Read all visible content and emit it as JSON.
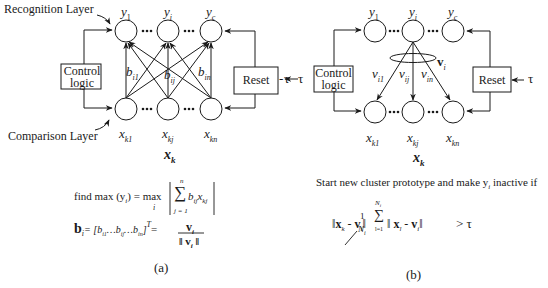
{
  "panel_a": {
    "recognition_label": "Recognition Layer",
    "comparison_label": "Comparison Layer",
    "control_label_1": "Control",
    "control_label_2": "logic",
    "reset_label": "Reset",
    "tau": "τ",
    "top_nodes": [
      "y",
      "y",
      "y"
    ],
    "top_subs": [
      "1",
      "i",
      "c"
    ],
    "bottom_nodes": [
      "x",
      "x",
      "x"
    ],
    "bottom_subs": [
      "k1",
      "kj",
      "kn"
    ],
    "weights": [
      "b",
      "b",
      "b"
    ],
    "weight_subs": [
      "i1",
      "ij",
      "in"
    ],
    "ellipsis": "•••",
    "vector_label": "x",
    "vector_sub": "k",
    "formula_line1_left": "find max (y",
    "formula_line1_sub": "i",
    "formula_line1_mid": ")  = max",
    "formula_line1_under": "i",
    "formula_sum_top": "n",
    "formula_sum_bottom": "j = 1",
    "formula_sum_body": "b",
    "formula_sum_body_sub": "ij",
    "formula_sum_x": "x",
    "formula_sum_x_sub": "kj",
    "formula_line2_left": "b",
    "formula_line2_sub": "i",
    "formula_line2_mid": "= [b",
    "formula_line2_terms": "i1 …b ij …b in ]",
    "formula_line2_T": "T",
    "formula_frac_num": "v",
    "formula_frac_den": "‖ v",
    "caption": "(a)"
  },
  "panel_b": {
    "control_label_1": "Control",
    "control_label_2": "logic",
    "reset_label": "Reset",
    "tau": "τ",
    "top_nodes": [
      "y",
      "y",
      "y"
    ],
    "top_subs": [
      "1",
      "i",
      "c"
    ],
    "bottom_nodes": [
      "x",
      "x",
      "x"
    ],
    "bottom_subs": [
      "k1",
      "kj",
      "kn"
    ],
    "weights": [
      "v",
      "v",
      "v"
    ],
    "weight_subs": [
      "i1",
      "ij",
      "in"
    ],
    "prototype_label": "v",
    "prototype_sub": "i",
    "ellipsis": "•••",
    "vector_label": "x",
    "vector_sub": "k",
    "condition_text": "Start new cluster prototype and make y",
    "condition_sub": "i",
    "condition_tail": " inactive if",
    "formula_gt": "> τ",
    "caption": "(b)"
  }
}
